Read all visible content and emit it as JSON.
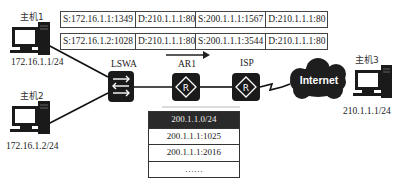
{
  "hosts": [
    {
      "name": "主机1",
      "ip": "172.16.1.1/24"
    },
    {
      "name": "主机2",
      "ip": "172.16.1.2/24"
    },
    {
      "name": "主机3",
      "ip": "210.1.1.1/24"
    }
  ],
  "devices": {
    "switch": "LSWA",
    "router1": "AR1",
    "router2": "ISP",
    "cloud": "Internet"
  },
  "packets_before_nat": [
    {
      "src": "S:172.16.1.1:1349",
      "dst": "D:210.1.1.1:80"
    },
    {
      "src": "S:172.16.1.2:1028",
      "dst": "D:210.1.1.1:80"
    }
  ],
  "packets_after_nat": [
    {
      "src": "S:200.1.1.1:1567",
      "dst": "D:210.1.1.1:80"
    },
    {
      "src": "S:200.1.1.1:3544",
      "dst": "D:210.1.1.1:80"
    }
  ],
  "nat_table": {
    "header": "200.1.1.0/24",
    "rows": [
      "200.1.1.1:1025",
      "200.1.1.1:2016",
      "……"
    ]
  },
  "colors": {
    "device_fill": "#1a1a1a",
    "line": "#111111",
    "cloud": "#1e1e1e"
  }
}
